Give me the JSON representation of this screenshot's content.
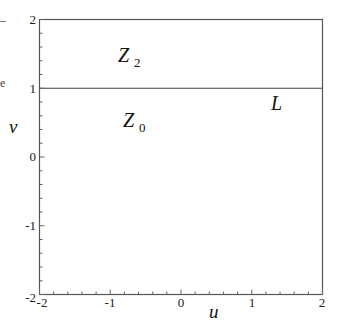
{
  "chart_data": {
    "type": "line",
    "title": "",
    "xlabel": "u",
    "ylabel": "v",
    "xlim": [
      -2,
      2
    ],
    "ylim": [
      -2,
      2
    ],
    "grid": false,
    "legend": null,
    "x_ticks": [
      "-2",
      "-1",
      "0",
      "1",
      "2"
    ],
    "y_ticks": [
      "-2",
      "-1",
      "0",
      "1",
      "2"
    ],
    "minor_tick_step": 0.2,
    "series": [
      {
        "name": "L",
        "x": [
          -2,
          2
        ],
        "y": [
          1,
          1
        ]
      }
    ],
    "annotations": [
      {
        "text": "Z",
        "subscript": "2",
        "x": -1.4,
        "y": 1.55,
        "description": "region v > 1"
      },
      {
        "text": "Z",
        "subscript": "0",
        "x": -1.4,
        "y": 0.75,
        "description": "region v < 1"
      },
      {
        "text": "L",
        "x": 1.3,
        "y": 0.8,
        "description": "line v = 1"
      }
    ]
  },
  "figure": {
    "axis_labels": {
      "x": "u",
      "y": "v"
    },
    "x_tick_labels": [
      "-2",
      "-1",
      "0",
      "1",
      "2"
    ],
    "y_tick_labels": [
      "2",
      "1",
      "0",
      "-1",
      "-2"
    ],
    "regions": [
      {
        "symbol": "Z",
        "sub": "2"
      },
      {
        "symbol": "Z",
        "sub": "0"
      }
    ],
    "line_label": "L",
    "stray_fragments": [
      "–",
      "e"
    ]
  }
}
